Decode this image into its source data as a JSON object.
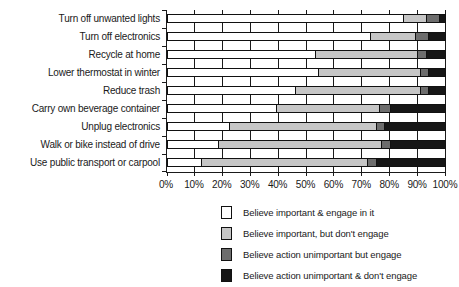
{
  "chart_data": {
    "type": "bar",
    "subtype": "horizontal-stacked-100pct",
    "title": "",
    "xlabel": "",
    "ylabel": "",
    "xlim": [
      0,
      100
    ],
    "x_ticks": [
      "0%",
      "10%",
      "20%",
      "30%",
      "40%",
      "50%",
      "60%",
      "70%",
      "80%",
      "90%",
      "100%"
    ],
    "grid": "vertical gridlines at every 10%",
    "legend_position": "bottom",
    "categories": [
      "Turn off unwanted lights",
      "Turn off electronics",
      "Recycle at home",
      "Lower thermostat in winter",
      "Reduce trash",
      "Carry own beverage container",
      "Unplug electronics",
      "Walk or bike instead of drive",
      "Use public transport or carpool"
    ],
    "series": [
      {
        "name": "Believe important & engage in it",
        "color": "#ffffff",
        "values": [
          85,
          73,
          53,
          54,
          46,
          39,
          22,
          18,
          12
        ]
      },
      {
        "name": "Believe important, but don't engage",
        "color": "#c6c6c6",
        "values": [
          8,
          16,
          37,
          37,
          45,
          37,
          53,
          59,
          60
        ]
      },
      {
        "name": "Believe action unimportant but engage",
        "color": "#6d6d6d",
        "values": [
          5,
          5,
          3,
          3,
          3,
          4,
          3,
          3,
          3
        ]
      },
      {
        "name": "Believe action unimportant & don't engage",
        "color": "#161616",
        "values": [
          2,
          6,
          7,
          6,
          6,
          20,
          22,
          20,
          25
        ]
      }
    ]
  },
  "colors": {
    "axis": "#1a1a1a",
    "bar_border": "#111111",
    "background": "#ffffff"
  }
}
